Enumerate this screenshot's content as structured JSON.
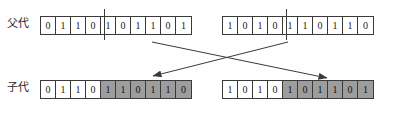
{
  "diagram": {
    "rows": [
      {
        "label": "父代"
      },
      {
        "label": "子代"
      }
    ],
    "colors": {
      "shaded_cell": "#9d9d9d",
      "plain_cell": "#ffffff",
      "border": "#3a3a3a",
      "arrow": "#3a3a3a",
      "background": "#fefefe"
    },
    "parents": [
      {
        "name": "parent-1",
        "crossover_point": 4,
        "bits": [
          {
            "value": "0",
            "shaded": false
          },
          {
            "value": "1",
            "shaded": false
          },
          {
            "value": "1",
            "shaded": false
          },
          {
            "value": "0",
            "shaded": false
          },
          {
            "value": "1",
            "shaded": false
          },
          {
            "value": "0",
            "shaded": false
          },
          {
            "value": "1",
            "shaded": false
          },
          {
            "value": "1",
            "shaded": false
          },
          {
            "value": "0",
            "shaded": false
          },
          {
            "value": "1",
            "shaded": false
          }
        ]
      },
      {
        "name": "parent-2",
        "crossover_point": 4,
        "bits": [
          {
            "value": "1",
            "shaded": false
          },
          {
            "value": "0",
            "shaded": false
          },
          {
            "value": "1",
            "shaded": false
          },
          {
            "value": "0",
            "shaded": false
          },
          {
            "value": "1",
            "shaded": false
          },
          {
            "value": "1",
            "shaded": false
          },
          {
            "value": "0",
            "shaded": false
          },
          {
            "value": "1",
            "shaded": false
          },
          {
            "value": "1",
            "shaded": false
          },
          {
            "value": "0",
            "shaded": false
          }
        ]
      }
    ],
    "children": [
      {
        "name": "child-1",
        "crossover_point": 4,
        "bits": [
          {
            "value": "0",
            "shaded": false
          },
          {
            "value": "1",
            "shaded": false
          },
          {
            "value": "1",
            "shaded": false
          },
          {
            "value": "0",
            "shaded": false
          },
          {
            "value": "1",
            "shaded": true
          },
          {
            "value": "1",
            "shaded": true
          },
          {
            "value": "0",
            "shaded": true
          },
          {
            "value": "1",
            "shaded": true
          },
          {
            "value": "1",
            "shaded": true
          },
          {
            "value": "0",
            "shaded": true
          }
        ]
      },
      {
        "name": "child-2",
        "crossover_point": 4,
        "bits": [
          {
            "value": "1",
            "shaded": false
          },
          {
            "value": "0",
            "shaded": false
          },
          {
            "value": "1",
            "shaded": false
          },
          {
            "value": "0",
            "shaded": false
          },
          {
            "value": "1",
            "shaded": true
          },
          {
            "value": "0",
            "shaded": true
          },
          {
            "value": "1",
            "shaded": true
          },
          {
            "value": "1",
            "shaded": true
          },
          {
            "value": "0",
            "shaded": true
          },
          {
            "value": "1",
            "shaded": true
          }
        ]
      }
    ],
    "arrows": [
      {
        "name": "arrow-parent2-to-child1",
        "x1": 288,
        "y1": 42,
        "x2": 153,
        "y2": 76
      },
      {
        "name": "arrow-parent1-to-child2",
        "x1": 152,
        "y1": 42,
        "x2": 327,
        "y2": 78
      }
    ]
  }
}
